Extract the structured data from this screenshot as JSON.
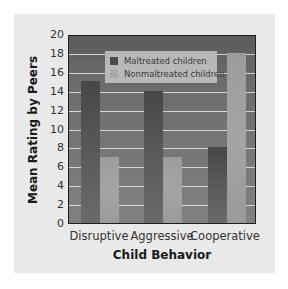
{
  "chart_data": {
    "type": "bar",
    "title": "",
    "xlabel": "Child Behavior",
    "ylabel": "Mean Rating by Peers",
    "categories": [
      "Disruptive",
      "Aggressive",
      "Cooperative"
    ],
    "series": [
      {
        "name": "Maltreated children",
        "values": [
          15,
          14,
          8
        ],
        "color": "#555555"
      },
      {
        "name": "Nonmaltreated children",
        "values": [
          7,
          7,
          18
        ],
        "color": "#a2a2a2"
      }
    ],
    "ylim": [
      0,
      20
    ],
    "yticks": [
      "0",
      "2",
      "4",
      "6",
      "8",
      "10",
      "12",
      "14",
      "16",
      "18",
      "20"
    ],
    "grid": true,
    "legend_position": "upper center (inside plot)"
  }
}
